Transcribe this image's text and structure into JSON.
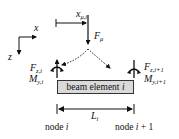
{
  "diagram": {
    "axes": {
      "x_label": "x",
      "z_label": "z"
    },
    "load_position": {
      "symbol": "x",
      "subscript": "μ,i"
    },
    "load": {
      "symbol": "F",
      "subscript": "μ"
    },
    "beam": {
      "label_prefix": "beam element ",
      "label_var": "i"
    },
    "length": {
      "symbol": "L",
      "subscript": "i"
    },
    "node_left": {
      "force_symbol": "F",
      "force_subscript": "z,i",
      "moment_symbol": "M",
      "moment_subscript": "y,i",
      "label_prefix": "node ",
      "label_var": "i"
    },
    "node_right": {
      "force_symbol": "F",
      "force_subscript": "z,i+1",
      "moment_symbol": "M",
      "moment_subscript": "y,i+1",
      "label_prefix": "node ",
      "label_var": "i",
      "label_suffix": " + 1"
    },
    "colors": {
      "line": "#111111",
      "beam_fill": "#d9d9d9",
      "beam_border": "#333333"
    }
  }
}
